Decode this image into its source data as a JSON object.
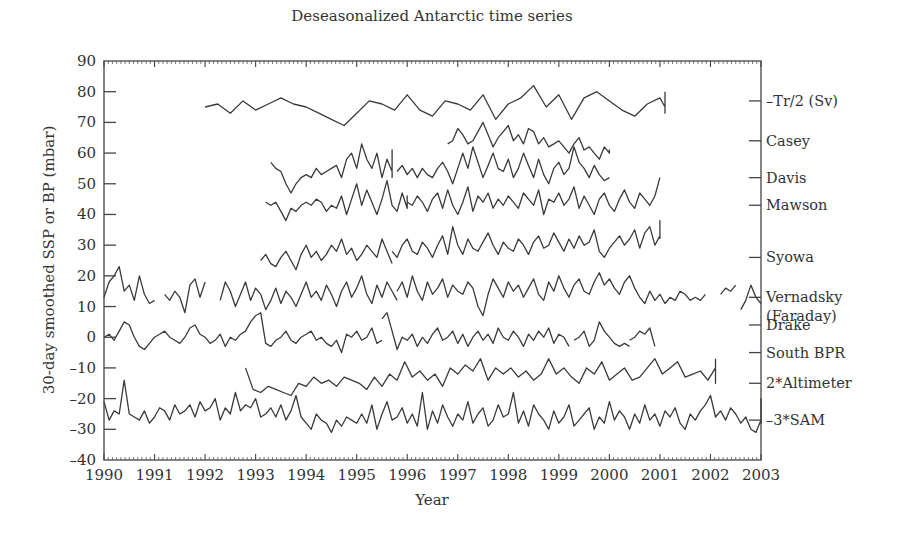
{
  "chart_data": {
    "type": "line",
    "title": "Deseasonalized Antarctic time series",
    "xlabel": "Year",
    "ylabel": "30-day smoothed SSP or BP (mbar)",
    "xlim": [
      1990,
      2003
    ],
    "ylim": [
      -40,
      90
    ],
    "xticks": [
      1990,
      1991,
      1992,
      1993,
      1994,
      1995,
      1996,
      1997,
      1998,
      1999,
      2000,
      2001,
      2002,
      2003
    ],
    "yticks": [
      90,
      80,
      70,
      60,
      50,
      40,
      30,
      20,
      10,
      0,
      -10,
      -20,
      -30,
      -40
    ],
    "grid": false,
    "legend_position": "right-side labels",
    "series": [
      {
        "name": "–Tr/2 (Sv)",
        "label_y": 77,
        "segments": [
          {
            "start": 1992.0,
            "end": 2001.1,
            "step": 0.25,
            "values": [
              75,
              76,
              73,
              77,
              74,
              76,
              78,
              76,
              75,
              73,
              71,
              69,
              73,
              77,
              76,
              74,
              79,
              74,
              72,
              77,
              76,
              74,
              79,
              71,
              76,
              78,
              82,
              75,
              79,
              71,
              78,
              80,
              77,
              74,
              72,
              76,
              78,
              75,
              77,
              77,
              74,
              76,
              74,
              75,
              73,
              76,
              75,
              73,
              79,
              80
            ]
          }
        ]
      },
      {
        "name": "Casey",
        "label_y": 64,
        "segments": [
          {
            "start": 1996.8,
            "end": 2000.0,
            "step": 0.1,
            "values": [
              63,
              64,
              68,
              66,
              63,
              64,
              67,
              70,
              66,
              62,
              65,
              67,
              69,
              64,
              66,
              63,
              68,
              67,
              63,
              65,
              62,
              63,
              64,
              62,
              60,
              63,
              65,
              61,
              62,
              60,
              58,
              62,
              60,
              61,
              61,
              60,
              61,
              61,
              61,
              60,
              61,
              60,
              61
            ]
          }
        ]
      },
      {
        "name": "Davis",
        "label_y": 52,
        "segments": [
          {
            "start": 1993.3,
            "end": 1995.7,
            "step": 0.1,
            "values": [
              57,
              55,
              54,
              50,
              47,
              50,
              52,
              53,
              52,
              55,
              53,
              54,
              55,
              56,
              52,
              58,
              60,
              55,
              63,
              58,
              55,
              60,
              52,
              58,
              54,
              52,
              55,
              60,
              53,
              52,
              56,
              61,
              57,
              53,
              55
            ]
          },
          {
            "start": 1995.8,
            "end": 2000.0,
            "step": 0.1,
            "values": [
              54,
              56,
              53,
              55,
              52,
              55,
              53,
              52,
              55,
              57,
              54,
              50,
              55,
              60,
              55,
              62,
              57,
              52,
              56,
              60,
              55,
              54,
              58,
              52,
              55,
              60,
              56,
              52,
              58,
              53,
              50,
              55,
              57,
              53,
              55,
              62,
              57,
              55,
              52,
              56,
              53,
              51,
              52
            ]
          }
        ]
      },
      {
        "name": "Mawson",
        "label_y": 43,
        "segments": [
          {
            "start": 1993.2,
            "end": 1996.0,
            "step": 0.1,
            "values": [
              44,
              43,
              44,
              41,
              38,
              42,
              41,
              43,
              44,
              43,
              45,
              44,
              41,
              43,
              42,
              46,
              40,
              45,
              50,
              43,
              48,
              44,
              40,
              45,
              51,
              43,
              41,
              47,
              42,
              44,
              46,
              43,
              45,
              42,
              44,
              43
            ]
          },
          {
            "start": 1996.0,
            "end": 2001.0,
            "step": 0.1,
            "values": [
              44,
              43,
              46,
              44,
              41,
              45,
              47,
              42,
              48,
              43,
              40,
              44,
              49,
              41,
              46,
              44,
              47,
              42,
              45,
              43,
              46,
              44,
              42,
              47,
              45,
              43,
              48,
              40,
              45,
              44,
              47,
              43,
              45,
              49,
              42,
              46,
              43,
              40,
              45,
              47,
              43,
              41,
              45,
              48,
              44,
              42,
              47,
              45,
              43,
              46,
              52
            ]
          }
        ]
      },
      {
        "name": "Syowa",
        "label_y": 26,
        "segments": [
          {
            "start": 1993.1,
            "end": 1995.7,
            "step": 0.1,
            "values": [
              25,
              27,
              24,
              23,
              26,
              28,
              25,
              22,
              27,
              30,
              26,
              28,
              25,
              27,
              30,
              28,
              32,
              27,
              29,
              25,
              27,
              30,
              28,
              26,
              32,
              28,
              24
            ]
          },
          {
            "start": 1995.7,
            "end": 2001.0,
            "step": 0.1,
            "values": [
              28,
              26,
              30,
              32,
              28,
              27,
              31,
              29,
              26,
              30,
              33,
              27,
              36,
              30,
              27,
              32,
              29,
              28,
              31,
              34,
              30,
              27,
              31,
              29,
              28,
              32,
              30,
              27,
              31,
              33,
              29,
              30,
              34,
              31,
              28,
              32,
              29,
              33,
              30,
              31,
              35,
              28,
              26,
              29,
              31,
              33,
              30,
              32,
              35,
              29,
              34,
              36,
              30,
              33,
              38,
              32
            ]
          }
        ]
      },
      {
        "name": "Vernadsky (Faraday)",
        "label_y": 13,
        "segments": [
          {
            "start": 1990.0,
            "end": 1991.0,
            "step": 0.1,
            "values": [
              13,
              18,
              20,
              23,
              15,
              17,
              12,
              20,
              14,
              11,
              12
            ]
          },
          {
            "start": 1991.2,
            "end": 1992.0,
            "step": 0.1,
            "values": [
              14,
              12,
              15,
              13,
              8,
              17,
              19,
              13,
              18
            ]
          },
          {
            "start": 1992.3,
            "end": 1995.8,
            "step": 0.1,
            "values": [
              12,
              18,
              15,
              10,
              14,
              18,
              12,
              16,
              14,
              9,
              12,
              16,
              11,
              15,
              13,
              10,
              14,
              18,
              13,
              15,
              12,
              17,
              14,
              10,
              15,
              18,
              13,
              16,
              20,
              14,
              11,
              17,
              13,
              18,
              15,
              12
            ]
          },
          {
            "start": 1995.8,
            "end": 2002.0,
            "step": 0.1,
            "values": [
              15,
              18,
              13,
              20,
              15,
              12,
              18,
              14,
              16,
              19,
              13,
              17,
              15,
              14,
              18,
              16,
              10,
              7,
              14,
              19,
              16,
              13,
              18,
              15,
              17,
              13,
              16,
              19,
              14,
              12,
              18,
              15,
              20,
              16,
              13,
              17,
              19,
              15,
              14,
              18,
              21,
              17,
              19,
              16,
              14,
              18,
              20,
              16,
              13,
              11,
              15,
              12,
              14,
              11,
              13,
              12,
              15,
              14,
              12,
              13,
              12,
              14
            ]
          },
          {
            "start": 2002.2,
            "end": 2002.5,
            "step": 0.1,
            "values": [
              14,
              16,
              15,
              17
            ]
          },
          {
            "start": 2002.6,
            "end": 2003.0,
            "step": 0.1,
            "values": [
              9,
              12,
              17,
              13,
              11
            ]
          }
        ]
      },
      {
        "name": "Drake",
        "label_y": 4,
        "segments": [
          {
            "start": 1990.0,
            "end": 1995.5,
            "step": 0.1,
            "values": [
              0,
              1,
              -1,
              2,
              5,
              4,
              0,
              -3,
              -4,
              -2,
              0,
              1,
              2,
              0,
              -1,
              -2,
              0,
              3,
              4,
              1,
              0,
              -2,
              -1,
              1,
              -3,
              0,
              -1,
              1,
              2,
              5,
              7,
              8,
              -2,
              -3,
              -1,
              0,
              2,
              -1,
              -2,
              0,
              1,
              2,
              -1,
              0,
              -2,
              -3,
              -1,
              -5,
              1,
              0,
              2,
              -1,
              0,
              3,
              -2,
              -1
            ]
          },
          {
            "start": 1995.5,
            "end": 1999.2,
            "step": 0.1,
            "values": [
              6,
              8,
              2,
              -4,
              0,
              -1,
              1,
              -3,
              0,
              -2,
              1,
              3,
              -1,
              0,
              2,
              -2,
              1,
              -3,
              0,
              2,
              -1,
              1,
              -2,
              3,
              0,
              -1,
              2,
              0,
              -3,
              1,
              -1,
              2,
              0,
              3,
              -2,
              1,
              0,
              -3
            ]
          },
          {
            "start": 1999.3,
            "end": 2000.4,
            "step": 0.1,
            "values": [
              -1,
              0,
              2,
              -3,
              -1,
              5,
              2,
              0,
              -2,
              -3,
              -2,
              -3
            ]
          },
          {
            "start": 2000.4,
            "end": 2000.9,
            "step": 0.1,
            "values": [
              -1,
              0,
              2,
              1,
              3,
              -3
            ]
          }
        ]
      },
      {
        "name": "South BPR",
        "label_y": -5,
        "segments": [
          {
            "start": 1992.8,
            "end": 2002.1,
            "step": 0.15,
            "values": [
              -10,
              -17,
              -18,
              -16,
              -17,
              -18,
              -19,
              -15,
              -16,
              -13,
              -15,
              -14,
              -16,
              -13,
              -14,
              -15,
              -17,
              -13,
              -16,
              -12,
              -14,
              -8,
              -13,
              -11,
              -14,
              -12,
              -16,
              -10,
              -12,
              -9,
              -11,
              -7,
              -14,
              -10,
              -12,
              -10,
              -13,
              -11,
              -14,
              -12,
              -7,
              -12,
              -10,
              -13,
              -15,
              -10,
              -12,
              -8,
              -14,
              -12,
              -10,
              -14,
              -13,
              -10,
              -7,
              -12,
              -10,
              -8,
              -13,
              -12,
              -11,
              -14,
              -10,
              -15,
              -7
            ]
          }
        ]
      },
      {
        "name": "2*Altimeter",
        "label_y": -15,
        "segments": []
      },
      {
        "name": "–3*SAM",
        "label_y": -27,
        "segments": [
          {
            "start": 1990.0,
            "end": 2003.0,
            "step": 0.1,
            "values": [
              -21,
              -27,
              -24,
              -25,
              -14,
              -25,
              -26,
              -27,
              -24,
              -28,
              -26,
              -23,
              -24,
              -27,
              -22,
              -25,
              -24,
              -22,
              -26,
              -21,
              -24,
              -23,
              -20,
              -27,
              -23,
              -25,
              -18,
              -24,
              -22,
              -23,
              -20,
              -26,
              -25,
              -23,
              -26,
              -22,
              -27,
              -24,
              -19,
              -26,
              -28,
              -30,
              -25,
              -27,
              -28,
              -31,
              -27,
              -29,
              -26,
              -27,
              -28,
              -25,
              -28,
              -22,
              -30,
              -25,
              -21,
              -27,
              -26,
              -23,
              -28,
              -25,
              -29,
              -18,
              -30,
              -24,
              -28,
              -22,
              -26,
              -29,
              -25,
              -27,
              -21,
              -28,
              -25,
              -23,
              -29,
              -27,
              -22,
              -26,
              -25,
              -18,
              -28,
              -24,
              -29,
              -22,
              -25,
              -27,
              -30,
              -24,
              -28,
              -26,
              -22,
              -29,
              -27,
              -25,
              -23,
              -30,
              -26,
              -28,
              -21,
              -27,
              -24,
              -26,
              -30,
              -25,
              -28,
              -22,
              -27,
              -25,
              -29,
              -24,
              -26,
              -23,
              -28,
              -30,
              -25,
              -27,
              -24,
              -22,
              -19,
              -26,
              -24,
              -27,
              -23,
              -25,
              -28,
              -26,
              -30,
              -31,
              -27,
              -21,
              -24,
              -20,
              -28,
              -25,
              -20
            ]
          }
        ]
      }
    ]
  },
  "labels": {
    "title": "Deseasonalized Antarctic time series",
    "xlabel": "Year",
    "ylabel": "30-day smoothed SSP or BP (mbar)"
  }
}
